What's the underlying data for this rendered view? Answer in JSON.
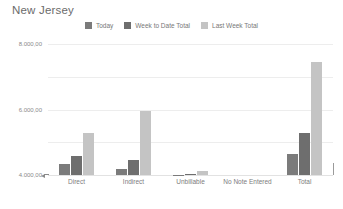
{
  "chart_data": {
    "type": "bar",
    "title": "New Jersey",
    "xlabel": "",
    "ylabel": "",
    "categories": [
      "Direct",
      "Indirect",
      "Unbillable",
      "No Note Entered",
      "Total"
    ],
    "series": [
      {
        "name": "Today",
        "color": "#7b7b7b",
        "values": [
          700,
          350,
          30,
          0,
          1300
        ]
      },
      {
        "name": "Week to Date Total",
        "color": "#6e6e6e",
        "values": [
          1150,
          900,
          60,
          0,
          2550
        ]
      },
      {
        "name": "Last Week Total",
        "color": "#c4c4c4",
        "values": [
          2550,
          3900,
          250,
          0,
          6900
        ]
      }
    ],
    "ylim": [
      0,
      8000
    ],
    "yticks": [
      {
        "value": 8000,
        "label": "8.000,00"
      },
      {
        "value": 6000,
        "label": "6.000,00"
      },
      {
        "value": 4000,
        "label": "4.000,00"
      },
      {
        "value": 2000,
        "label": "2.000,00"
      },
      {
        "value": 0,
        "label": "0,00"
      }
    ],
    "grid": true,
    "legend_position": "top-center"
  },
  "legend": {
    "items": [
      {
        "label": "Today",
        "swatch": "legend-swatch-today",
        "color": "#7b7b7b"
      },
      {
        "label": "Week to Date Total",
        "swatch": "legend-swatch-week-to-date-total",
        "color": "#6e6e6e"
      },
      {
        "label": "Last Week Total",
        "swatch": "legend-swatch-last-week-total",
        "color": "#c4c4c4"
      }
    ]
  }
}
